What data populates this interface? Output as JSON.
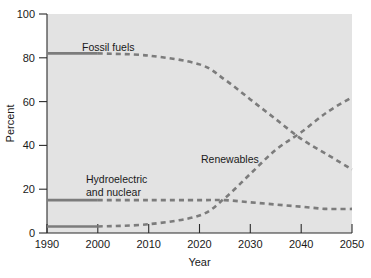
{
  "chart_data": {
    "type": "line",
    "title": "",
    "xlabel": "Year",
    "ylabel": "Percent",
    "xlim": [
      1990,
      2050
    ],
    "ylim": [
      0,
      100
    ],
    "xticks": [
      1990,
      2000,
      2010,
      2020,
      2030,
      2040,
      2050
    ],
    "xtick_labels": [
      "1990",
      "2000",
      "2010",
      "2020",
      "2030",
      "2040",
      "2050"
    ],
    "yticks": [
      0,
      20,
      40,
      60,
      80,
      100
    ],
    "ytick_labels": [
      "0",
      "20",
      "40",
      "60",
      "80",
      "100"
    ],
    "grid": false,
    "legend": "inline-annotations",
    "line_color": "#7c7c7c",
    "plot_background": "#e3e3e3",
    "note": "Solid segments are historical (1990-2000); dashed segments are projected (2000-2050).",
    "x": [
      1990,
      2000,
      2010,
      2020,
      2025,
      2030,
      2035,
      2040,
      2045,
      2050
    ],
    "series": [
      {
        "name": "Fossil fuels",
        "label": "Fossil fuels",
        "solid_until": 2000,
        "values": [
          82,
          82,
          81,
          77,
          70,
          61,
          52,
          43,
          36,
          29
        ]
      },
      {
        "name": "Hydroelectric and nuclear",
        "label_line1": "Hydroelectric",
        "label_line2": "and nuclear",
        "solid_until": 2000,
        "values": [
          15,
          15,
          15,
          15,
          15,
          14,
          13,
          12,
          11,
          11
        ]
      },
      {
        "name": "Renewables",
        "label": "Renewables",
        "solid_until": 2000,
        "values": [
          3,
          3,
          4,
          8,
          16,
          27,
          38,
          46,
          55,
          62
        ]
      }
    ],
    "annotations": [
      {
        "text": "Fossil fuels",
        "x": 2002,
        "y": 88
      },
      {
        "text": "Hydroelectric",
        "x": 2000,
        "y": 26
      },
      {
        "text": "and nuclear",
        "x": 2000,
        "y": 21
      },
      {
        "text": "Renewables",
        "x": 2024,
        "y": 36
      }
    ]
  }
}
